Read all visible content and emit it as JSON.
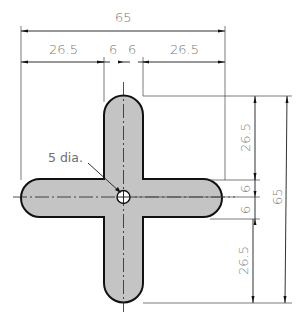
{
  "drawing": {
    "type": "engineering-drawing",
    "subject": "cross-shaped plate with center hole",
    "colors": {
      "fill": "#c4c4c4",
      "outline": "#111111",
      "text": "#7a7a7a"
    },
    "dimensions": {
      "overall_width": "65",
      "overall_height": "65",
      "horizontal": {
        "left_arm": "26.5",
        "left_half_width": "6",
        "right_half_width": "6",
        "right_arm": "26.5"
      },
      "vertical": {
        "top_arm": "26.5",
        "upper_half_width": "6",
        "lower_half_width": "6",
        "bottom_arm": "26.5"
      }
    },
    "hole_callout": "5 dia."
  }
}
